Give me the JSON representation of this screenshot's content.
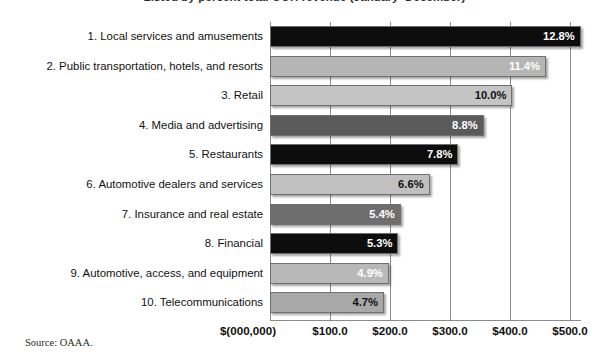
{
  "chart_data": {
    "type": "bar",
    "orientation": "horizontal",
    "title": "Listed by percent total OOH revenue (January–December)",
    "xlabel": "$(000,000)",
    "ylabel": "",
    "xlim": [
      0,
      520
    ],
    "grid": true,
    "legend": null,
    "source": "Source: OAAA.",
    "xticks": [
      "$100.0",
      "$200.0",
      "$300.0",
      "$400.0",
      "$500.0"
    ],
    "xtick_values": [
      100,
      200,
      300,
      400,
      500
    ],
    "categories": [
      "1. Local services and amusements",
      "2. Public transportation, hotels, and resorts",
      "3. Retail",
      "4. Media and advertising",
      "5. Restaurants",
      "6. Automotive dealers and services",
      "7. Insurance and real estate",
      "8. Financial",
      "9. Automotive, access, and equipment",
      "10. Telecommunications"
    ],
    "values": [
      518,
      460,
      404,
      356,
      314,
      266,
      218,
      214,
      198,
      190
    ],
    "data_labels": [
      "12.8%",
      "11.4%",
      "10.0%",
      "8.8%",
      "7.8%",
      "6.6%",
      "5.4%",
      "5.3%",
      "4.9%",
      "4.7%"
    ],
    "bar_colors": [
      "#0d0d0d",
      "#b5b5b5",
      "#c4c4c4",
      "#5a5a5a",
      "#0d0d0d",
      "#c0c0c0",
      "#6e6e6e",
      "#0d0d0d",
      "#b8b8b8",
      "#a8a8a8"
    ],
    "label_colors": [
      "#ffffff",
      "#ffffff",
      "#111111",
      "#ffffff",
      "#ffffff",
      "#111111",
      "#ffffff",
      "#ffffff",
      "#ffffff",
      "#111111"
    ]
  }
}
